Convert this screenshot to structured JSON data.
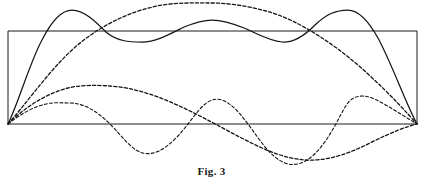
{
  "figure": {
    "caption": "Fig. 3",
    "title": "Fig. 3",
    "background_color": "#ffffff",
    "ink_color": "#151515",
    "frame_color": "#1a1a1a",
    "width": 423,
    "height": 182
  },
  "frame": {
    "name": "bounding-rectangle",
    "x": 8,
    "y": 31,
    "width": 409,
    "height": 93,
    "stroke": "#1a1a1a",
    "stroke_width": 1
  },
  "chart_data": {
    "type": "line",
    "title": "Fig. 3",
    "subtitle": "",
    "xlabel": "",
    "ylabel": "",
    "grid": false,
    "legend": "none",
    "xlim": [
      0,
      1
    ],
    "ylim": [
      -0.45,
      1.3
    ],
    "axis_baseline_y": 124,
    "x_start_px": 8,
    "x_end_px": 417,
    "series": [
      {
        "name": "resultant",
        "style": "solid",
        "stroke": "#151515",
        "stroke_width": 1.25,
        "nodes": 0,
        "antinodes": 3,
        "peak_points_px": [
          {
            "x": 72,
            "y": 10
          },
          {
            "x": 210,
            "y": 20
          },
          {
            "x": 348,
            "y": 10
          }
        ],
        "trough_points_px": [
          {
            "x": 140,
            "y": 42
          },
          {
            "x": 280,
            "y": 42
          }
        ],
        "endpoints_px": [
          {
            "x": 8,
            "y": 124
          },
          {
            "x": 417,
            "y": 124
          }
        ]
      },
      {
        "name": "fundamental",
        "style": "dashed",
        "stroke": "#151515",
        "stroke_width": 1.3,
        "nodes": 0,
        "antinodes": 1,
        "peak_points_px": [
          {
            "x": 212,
            "y": 3
          }
        ],
        "trough_points_px": [],
        "endpoints_px": [
          {
            "x": 8,
            "y": 124
          },
          {
            "x": 417,
            "y": 124
          }
        ]
      },
      {
        "name": "second-harmonic",
        "style": "dashed",
        "stroke": "#151515",
        "stroke_width": 1.3,
        "nodes": 1,
        "antinodes": 2,
        "peak_points_px": [
          {
            "x": 110,
            "y": 86
          }
        ],
        "trough_points_px": [
          {
            "x": 315,
            "y": 160
          }
        ],
        "endpoints_px": [
          {
            "x": 8,
            "y": 124
          },
          {
            "x": 417,
            "y": 124
          }
        ]
      },
      {
        "name": "third-harmonic",
        "style": "dashed",
        "stroke": "#151515",
        "stroke_width": 1.1,
        "nodes": 2,
        "antinodes": 3,
        "peak_points_px": [
          {
            "x": 70,
            "y": 103
          },
          {
            "x": 212,
            "y": 100
          },
          {
            "x": 352,
            "y": 99
          }
        ],
        "trough_points_px": [
          {
            "x": 140,
            "y": 152
          },
          {
            "x": 285,
            "y": 163
          }
        ],
        "endpoints_px": [
          {
            "x": 8,
            "y": 124
          },
          {
            "x": 417,
            "y": 124
          }
        ]
      }
    ]
  },
  "paths": {
    "frame_rect": "M 8 124 L 8 31 L 417 31 L 417 124 Z",
    "resultant_solid": "M 8 124 C 18 104 30 62 42 40 C 52 20 62 10 72 10 C 84 10 96 22 106 32 C 118 42 130 42 142 42 C 156 42 170 34 184 27 C 196 22 204 20 212 20 C 222 20 232 23 244 28 C 258 34 270 41 282 42 C 294 43 304 36 314 26 C 326 14 336 10 348 10 C 358 10 368 20 378 38 C 392 64 406 104 417 124",
    "fundamental_dashed": "M 8 124 C 26 104 48 72 72 50 C 100 24 140 6 174 3.6 C 190 2.6 200 3 212 3 C 228 3 248 6 266 11 C 300 20 340 48 368 74 C 392 96 408 114 417 124",
    "second_harmonic_dashed": "M 8 124 C 22 110 44 94 68 88 C 80 85 96 85 110 86 C 140 88 168 100 196 114 C 218 125 240 138 262 148 C 282 157 300 161 315 160 C 334 159 352 152 370 143 C 392 132 408 126 417 124",
    "third_harmonic_dashed": "M 8 124 C 18 116 32 107 46 104 C 54 102 62 103 70 103 C 84 103 98 112 110 124 C 122 136 130 148 140 152 C 152 157 164 150 176 138 C 190 124 200 104 212 100 C 224 96 236 108 248 124 C 260 140 270 157 285 163 C 298 168 312 160 324 143 C 338 124 344 104 352 99 C 362 93 372 97 384 104 C 398 112 410 120 417 124"
  },
  "elements": {
    "caption_label": "Fig. 3"
  }
}
